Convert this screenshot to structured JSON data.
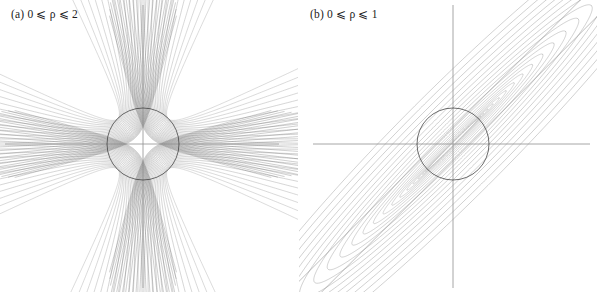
{
  "figure": {
    "background": "#ffffff",
    "width": 597,
    "height": 292,
    "axis_color": "#8f8f8f",
    "circle_color": "#3c3c3c",
    "curve_color": "#555555"
  },
  "panels": [
    {
      "id": "a",
      "label": "(a) 0 ⩽ ρ ⩽ 2",
      "label_prefix": "(a)",
      "rho_min": 0,
      "rho_max": 2,
      "center": {
        "x": 143,
        "y": 144
      },
      "radius": 36,
      "axes": {
        "x_from": 5,
        "x_to": 279,
        "x_y": 144,
        "y_from": 5,
        "y_to": 288,
        "y_x": 143
      },
      "n_curves": 26,
      "tangent_angles_deg": [
        60,
        120,
        240,
        300
      ],
      "family": "hyperbolic-fan"
    },
    {
      "id": "b",
      "label": "(b) 0 ⩽ ρ ⩽ 1",
      "label_prefix": "(b)",
      "rho_min": 0,
      "rho_max": 1,
      "center": {
        "x": 154,
        "y": 144
      },
      "radius": 36,
      "axes": {
        "x_from": 14,
        "x_to": 291,
        "x_y": 144,
        "y_from": 5,
        "y_to": 288,
        "y_x": 154
      },
      "n_curves": 22,
      "tangent_angles_deg": [
        45,
        225
      ],
      "family": "elliptic-loops"
    }
  ],
  "chart_data": {
    "type": "line",
    "title": "",
    "xlabel": "",
    "ylabel": "",
    "grid": false,
    "legend": null,
    "series": [
      {
        "name": "(a) 0 ⩽ ρ ⩽ 2",
        "parameter": "ρ",
        "parameter_range": [
          0,
          2
        ],
        "curve_count": 26,
        "shape": "hyperbola-like branches fanning out to the upper-right / lower-left and upper-left / lower-right, all passing through four common points on the unit circle"
      },
      {
        "name": "(b) 0 ⩽ ρ ⩽ 1",
        "parameter": "ρ",
        "parameter_range": [
          0,
          1
        ],
        "curve_count": 22,
        "shape": "nested elongated ellipse loops along the 45° diagonal, tangent to the unit circle at two antipodal points, bounded by two straight diagonal lines"
      }
    ],
    "xlim": [
      -4,
      4
    ],
    "ylim": [
      -4,
      4
    ]
  }
}
